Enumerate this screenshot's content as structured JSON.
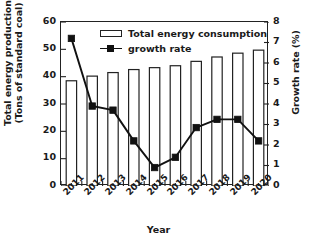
{
  "chart_data": {
    "type": "bar",
    "title": "",
    "xlabel": "Year",
    "ylabel": "Total energy production (Tons of standard coal)",
    "ylabel_line1": "Total energy production",
    "ylabel_line2": "(Tons of standard coal)",
    "y2label": "Growth rate (%)",
    "categories": [
      "2011",
      "2012",
      "2013",
      "2014",
      "2015",
      "2016",
      "2017",
      "2018",
      "2019",
      "2020"
    ],
    "ylim": [
      0,
      60
    ],
    "yticks": [
      0,
      10,
      20,
      30,
      40,
      50,
      60
    ],
    "y2lim": [
      0,
      8
    ],
    "y2ticks": [
      0,
      1,
      2,
      3,
      4,
      5,
      6,
      7,
      8
    ],
    "grid": false,
    "legend_position": "top-center",
    "series": [
      {
        "name": "Total energy consumption",
        "type": "bar",
        "axis": "left",
        "color": "#ffffff",
        "edge_color": "#222222",
        "values": [
          38.5,
          40.2,
          41.5,
          42.6,
          43.3,
          44.0,
          45.6,
          47.2,
          48.6,
          49.7
        ]
      },
      {
        "name": "growth rate",
        "type": "line",
        "axis": "right",
        "color": "#111111",
        "marker": "square",
        "values": [
          7.2,
          3.9,
          3.7,
          2.2,
          0.9,
          1.4,
          2.85,
          3.25,
          3.25,
          2.2
        ]
      }
    ]
  },
  "legend": {
    "items": [
      {
        "label": "Total energy consumption",
        "kind": "bar"
      },
      {
        "label": "growth rate",
        "kind": "line"
      }
    ]
  },
  "colors": {
    "axis": "#222222",
    "line": "#111111",
    "bar_fill": "#ffffff",
    "bar_edge": "#222222",
    "background": "#ffffff"
  }
}
